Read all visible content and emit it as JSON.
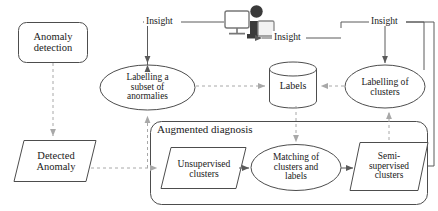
{
  "diagram": {
    "colors": {
      "stroke": "#4d4d4d",
      "dashed_stroke": "#a6a6a6",
      "text": "#1a1a1a",
      "background": "#ffffff",
      "icon_dark": "#3a3a3a",
      "icon_light": "#e8e8e8"
    },
    "nodes": [
      {
        "id": "anomaly-detection",
        "shape": "rounded-rect",
        "label": "Anomaly\ndetection",
        "x": 18,
        "y": 22,
        "w": 70,
        "h": 41
      },
      {
        "id": "detected-anomaly",
        "shape": "parallelogram",
        "label": "Detected\nAnomaly",
        "x": 14,
        "y": 140,
        "w": 82,
        "h": 42
      },
      {
        "id": "labelling-subset-anomalies",
        "shape": "ellipse",
        "label": "Labelling a\nsubset of\nanormalies",
        "x": 100,
        "y": 65,
        "w": 95,
        "h": 45
      },
      {
        "id": "labels-store",
        "shape": "cylinder",
        "label": "Labels",
        "x": 269,
        "y": 62,
        "w": 47,
        "h": 46
      },
      {
        "id": "labelling-of-clusters",
        "shape": "ellipse",
        "label": "Labelling of\nclusters",
        "x": 345,
        "y": 65,
        "w": 80,
        "h": 43
      },
      {
        "id": "unsupervised-clusters",
        "shape": "parallelogram",
        "label": "Unsupervised\nclusters",
        "x": 161,
        "y": 147,
        "w": 85,
        "h": 42
      },
      {
        "id": "matching-clusters-labels",
        "shape": "ellipse",
        "label": "Matching of\nclusters and\nlabels",
        "x": 251,
        "y": 144,
        "w": 90,
        "h": 46
      },
      {
        "id": "semi-supervised-clusters",
        "shape": "parallelogram",
        "label": "Semi-\nsupervised\nclusters",
        "x": 350,
        "y": 142,
        "w": 78,
        "h": 48
      },
      {
        "id": "human-analyst",
        "shape": "icon",
        "label": "",
        "x": 224,
        "y": 4,
        "w": 50,
        "h": 36
      }
    ],
    "groups": [
      {
        "id": "augmented-diagnosis",
        "title": "Augmented diagnosis",
        "x": 150,
        "y": 121,
        "w": 278,
        "h": 84
      }
    ],
    "edge_labels": [
      {
        "id": "insight-left",
        "text": "Insight",
        "x": 144,
        "y": 15
      },
      {
        "id": "insight-middle",
        "text": "Insight",
        "x": 263,
        "y": 31
      },
      {
        "id": "insight-right",
        "text": "Insight",
        "x": 370,
        "y": 15
      }
    ]
  }
}
